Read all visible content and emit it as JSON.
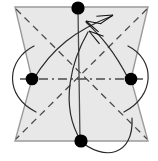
{
  "figure": {
    "width": 158,
    "height": 161,
    "background_color": "#ffffff"
  },
  "colors": {
    "node_fill": "#000000",
    "polygon_fill": "#e8e8e8",
    "polygon_stroke": "#9a9a9a",
    "dashed_stroke": "#4a4a4a",
    "curve_stroke": "#2a2a2a",
    "arrow_fill": "#111111"
  },
  "polygon": {
    "name": "bowtie-region",
    "fill": "#e8e8e8",
    "stroke": "#9a9a9a",
    "stroke_width": 1.4,
    "points": "15,7 148,7 131,79 148,141 15,141 32,79"
  },
  "nodes": [
    {
      "id": "top",
      "label": "",
      "cx": 78,
      "cy": 8,
      "r": 6.6
    },
    {
      "id": "left",
      "label": "",
      "cx": 32,
      "cy": 79,
      "r": 6.3
    },
    {
      "id": "right",
      "label": "",
      "cx": 131,
      "cy": 79,
      "r": 6.3
    },
    {
      "id": "bottom",
      "label": "",
      "cx": 81,
      "cy": 141,
      "r": 6.6
    }
  ],
  "dashed_edges": [
    {
      "id": "diag-tl-br",
      "d": "M 16,9 L 147,139",
      "dash": "7 5"
    },
    {
      "id": "diag-tr-bl",
      "d": "M 147,9 L 16,139",
      "dash": "7 5"
    },
    {
      "id": "mid-horizontal",
      "d": "M 20,79 L 143,79",
      "dash": "9 4 2 4"
    },
    {
      "id": "vertical-axis",
      "d": "M 78,9 L 80,140",
      "dash": "none"
    }
  ],
  "curved_edges": [
    {
      "id": "loop-left",
      "d": "M 34,46 C 6,60 4,96 36,112"
    },
    {
      "id": "loop-right",
      "d": "M 128,46 C 156,60 155,96 124,112"
    },
    {
      "id": "loop-bottom",
      "d": "M 79,140 C 104,162 134,156 132,118"
    },
    {
      "id": "arc-left-to-top",
      "d": "M 33,80 C 52,48 76,30 112,16"
    },
    {
      "id": "arc-right-to-top",
      "d": "M 129,80 C 112,46 96,32 86,22"
    },
    {
      "id": "arc-bottom-to-top",
      "d": "M 81,141 C 58,104 73,58 88,32"
    }
  ],
  "arrowheads": [
    {
      "id": "arrow-to-top-from-left",
      "tip_x": 113,
      "tip_y": 15,
      "angle": -20
    },
    {
      "id": "arrow-to-top-from-right",
      "tip_x": 86,
      "tip_y": 21,
      "angle": 205
    },
    {
      "id": "arrow-to-top-from-bottom",
      "tip_x": 89,
      "tip_y": 31,
      "angle": 215
    }
  ]
}
